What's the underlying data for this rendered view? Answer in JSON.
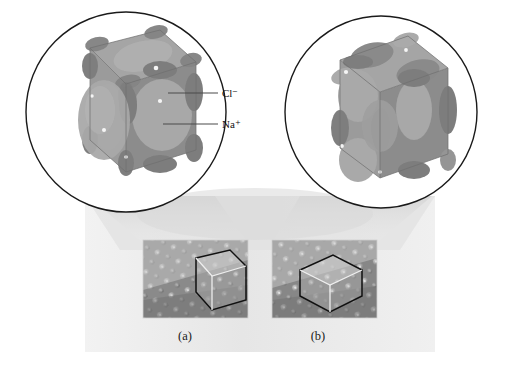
{
  "figure": {
    "background_color": "#ffffff",
    "panel_color": "#ededed",
    "labels": {
      "chloride": "Cl⁻",
      "sodium": "Na⁺",
      "panel_a": "(a)",
      "panel_b": "(b)"
    },
    "icons": {
      "magnifier_left": "magnified-unit-cell-left-icon",
      "magnifier_right": "magnified-unit-cell-right-icon",
      "cube_overlay_a": "cube-wireframe-overlay-icon",
      "cube_overlay_b": "cube-wireframe-overlay-icon"
    },
    "colors": {
      "cube_top_face": "#a3a3a3",
      "cube_left_face": "#9a9a9a",
      "cube_right_face": "#8b8b8b",
      "sphere_light": "#b4b4b4",
      "sphere_dark": "#7e7e7e",
      "circle_stroke": "#1a1a1a",
      "leader_line": "#4a4a4a",
      "cone_fill": "#dcdcdc",
      "micrograph_base": "#8f8f8f"
    },
    "circles": [
      {
        "name": "left-magnifier",
        "cx": 126,
        "cy": 112,
        "r": 101
      },
      {
        "name": "right-magnifier",
        "cx": 381,
        "cy": 112,
        "r": 97
      }
    ],
    "micrographs": [
      {
        "name": "micrograph-a",
        "x": 143,
        "y": 240,
        "w": 105,
        "h": 78,
        "label": "(a)"
      },
      {
        "name": "micrograph-b",
        "x": 272,
        "y": 240,
        "w": 105,
        "h": 78,
        "label": "(b)"
      }
    ],
    "leaders": [
      {
        "name": "chloride-leader",
        "x1": 168,
        "y1": 93,
        "x2": 218,
        "y2": 93
      },
      {
        "name": "sodium-leader",
        "x1": 163,
        "y1": 124,
        "x2": 218,
        "y2": 124
      }
    ]
  }
}
